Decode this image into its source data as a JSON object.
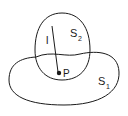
{
  "diagram": {
    "labels": {
      "line": "l",
      "point": "P",
      "region2": "S",
      "region2_sub": "2",
      "region1": "S",
      "region1_sub": "1"
    },
    "colors": {
      "stroke": "#1a1a1a",
      "background": "#ffffff"
    }
  }
}
